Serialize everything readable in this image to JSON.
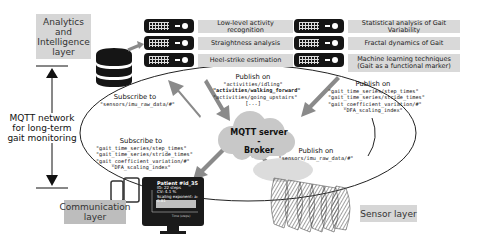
{
  "layers": {
    "analytics": "Analytics and Intelligence layer",
    "analytics_lines": [
      "Analytics",
      "and",
      "Intelligence",
      "layer"
    ],
    "communication_lines": [
      "Communication",
      "layer"
    ],
    "sensor": "Sensor layer"
  },
  "network_label_lines": [
    "MQTT network",
    "for long-term",
    "gait monitoring"
  ],
  "broker": {
    "lines": [
      "MQTT server -",
      "Broker"
    ],
    "color": "#c8c8c8"
  },
  "services": {
    "left": [
      "Low-level activity recognition",
      "Straightness analysis",
      "Heel-strike estimation"
    ],
    "right": [
      "Statistical analysis of Gait Variability",
      "Fractal dynamics of Gait",
      "Machine learning techniques (Gait as a functional marker)"
    ],
    "right_ml_lines": [
      "Machine learning techniques",
      "(Gait as a functional marker)"
    ]
  },
  "flows": {
    "subscribe_raw": {
      "title": "Subscribe to",
      "topics": [
        "\"sensors/imu_raw_data/#\""
      ]
    },
    "publish_activities": {
      "title": "Publish on",
      "topics": [
        "\"activities/idling\"",
        "\"activities/walking_forward\"",
        "\"activities/going_upstairs\"",
        "[...]"
      ],
      "highlighted_index": 1
    },
    "publish_gait": {
      "title": "Publish on",
      "topics": [
        "\"gait_time_series/step_times\"",
        "\"gait_time_series/stride_times\"",
        "\"gait_coefficient_variation/#\"",
        "\"DFA_scaling_index\""
      ]
    },
    "subscribe_gait": {
      "title": "Subscribe to",
      "topics": [
        "\"gait_time_series/step_times\"",
        "\"gait_time_series/stride_times\"",
        "\"gait_coefficient_variation/#\"",
        "\"DFA_scaling_index\""
      ]
    },
    "publish_raw": {
      "title": "Publish on",
      "topics": [
        "\"sensors/imu_raw_data/#\""
      ]
    }
  },
  "monitor": {
    "patient": "Patient #id_35",
    "lines": [
      "ID: 22 steps",
      "CV: 4.1 %",
      "Scaling exponent: a: 0.81"
    ],
    "xlabel": "Time (steps)",
    "ylabel": "Stride Time (ms)"
  },
  "colors": {
    "arrow": "#8a8a8a",
    "box": "#d6d6d6",
    "server": "#151515"
  }
}
